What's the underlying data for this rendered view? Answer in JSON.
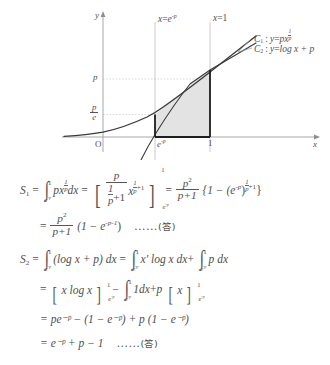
{
  "figure": {
    "type": "math-diagram",
    "axis": {
      "x_axis_label": "x",
      "y_axis_label": "y",
      "origin_label": "O"
    },
    "y_ticks": [
      {
        "label_num": "p",
        "label_den": "",
        "value": "p"
      },
      {
        "label_num": "p",
        "label_den": "e",
        "value": "p/e"
      }
    ],
    "x_ticks": [
      {
        "label": "e",
        "exp": "-p"
      },
      {
        "label": "1",
        "exp": ""
      }
    ],
    "vertical_lines": [
      {
        "label_lhs": "x",
        "label_eq": "=",
        "label_base": "e",
        "label_exp": "-p"
      },
      {
        "label_lhs": "x",
        "label_eq": "=",
        "label_base": "1",
        "label_exp": ""
      }
    ],
    "curves": [
      {
        "name": "C",
        "index": "1",
        "sep": ":",
        "y": "y",
        "eq": "=",
        "coef": "px",
        "exp_num": "1",
        "exp_den": "p"
      },
      {
        "name": "C",
        "index": "2",
        "sep": ":",
        "y": "y",
        "eq": "=",
        "expr": "log x + p"
      }
    ],
    "shaded_region": "area between C1 and C2 from x=e^(-p) to x=1"
  },
  "math": {
    "s1_label": "S",
    "s1_index": "1",
    "s2_label": "S",
    "s2_index": "2",
    "eq": "=",
    "minus": "−",
    "plus": "+",
    "dx": "dx",
    "one": "1",
    "p": "p",
    "e": "e",
    "x": "x",
    "log": "log",
    "lim_lo": "e",
    "lim_lo_exp": "-p",
    "lim_up": "1",
    "integrand1": "px",
    "exp_num": "1",
    "exp_den": "p",
    "exp_plus_one": "+1",
    "p_sq": "p",
    "sq": "2",
    "p_plus_1": "p+1",
    "brace_open": "{1 − (e",
    "brace_exp": "-p",
    "brace_mid": ")",
    "brace_close": "}",
    "line2_num": "p",
    "line2_sq": "2",
    "line2_den": "p+1",
    "line2_tail": "(1 − e",
    "line2_exp": "-p-1",
    "line2_end": ")",
    "dots": "……",
    "answer": "(答)",
    "s2_integrand": "(log x + p) dx",
    "s2_t1": "x′ log x dx",
    "s2_t2": "p dx",
    "s2_l2_a": "x log x",
    "s2_l2_b": "1dx",
    "s2_l2_c": "x",
    "s2_l3": "= pe⁻ᵖ − (1 − e⁻ᵖ) + p (1 − e⁻ᵖ)",
    "s2_l4": "= e⁻ᵖ + p − 1"
  }
}
